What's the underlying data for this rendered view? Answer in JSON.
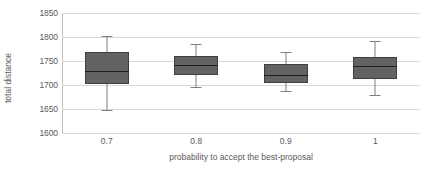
{
  "chart_data": {
    "type": "box",
    "title": "",
    "xlabel": "probability to accept the best-proposal",
    "ylabel": "total distance",
    "ylim": [
      1600,
      1850
    ],
    "ytick_step": 50,
    "ytick_labels": [
      "1850",
      "1800",
      "1750",
      "1700",
      "1650",
      "1600"
    ],
    "ytick_values": [
      1850,
      1800,
      1750,
      1700,
      1650,
      1600
    ],
    "grid": true,
    "legend": "none",
    "categories": [
      "0.7",
      "0.8",
      "0.9",
      "1"
    ],
    "boxes": [
      {
        "category": "0.7",
        "whisker_low": 1647,
        "q1": 1703,
        "median": 1730,
        "q3": 1768,
        "whisker_high": 1802
      },
      {
        "category": "0.8",
        "whisker_low": 1695,
        "q1": 1720,
        "median": 1742,
        "q3": 1760,
        "whisker_high": 1785
      },
      {
        "category": "0.9",
        "whisker_low": 1687,
        "q1": 1704,
        "median": 1721,
        "q3": 1744,
        "whisker_high": 1768
      },
      {
        "category": "1",
        "whisker_low": 1680,
        "q1": 1712,
        "median": 1740,
        "q3": 1759,
        "whisker_high": 1791
      }
    ],
    "colors": {
      "box_fill": "#636363",
      "box_border": "#3f3f3f",
      "median": "#1f1f1f",
      "whisker": "#7f7f7f",
      "gridline": "#d9d9d9",
      "axis": "#bfbfbf",
      "text": "#5a5a5a",
      "background": "#ffffff"
    }
  }
}
